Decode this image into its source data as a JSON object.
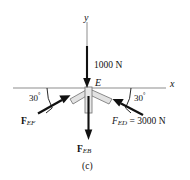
{
  "figure": {
    "caption": "(c)",
    "axes": {
      "x_label": "x",
      "y_label": "y"
    },
    "joint_label": "E",
    "loads": [
      {
        "name": "applied-load",
        "label": "1000 N",
        "direction": "down",
        "magnitude": 1000,
        "unit": "N"
      }
    ],
    "members": [
      {
        "name": "F_EF",
        "label_bold": "F",
        "label_sub": "EF",
        "angle_deg": 30,
        "angle_label": "30",
        "angle_unit": "°",
        "side": "left",
        "arrow_direction": "toward-joint"
      },
      {
        "name": "F_ED",
        "label_bold": "F",
        "label_sub": "ED",
        "value_text": "= 3000 N",
        "magnitude": 3000,
        "unit": "N",
        "angle_deg": 30,
        "angle_label": "30",
        "angle_unit": "°",
        "side": "right",
        "arrow_direction": "away-from-joint"
      },
      {
        "name": "F_EB",
        "label_bold": "F",
        "label_sub": "EB",
        "direction": "down",
        "arrow_direction": "away-from-joint"
      }
    ],
    "colors": {
      "stroke": "#111111",
      "axis": "#8d8d8d",
      "member_fill": "#e2e2e2",
      "member_stroke": "#6f6f6f",
      "background": "#ffffff"
    }
  }
}
